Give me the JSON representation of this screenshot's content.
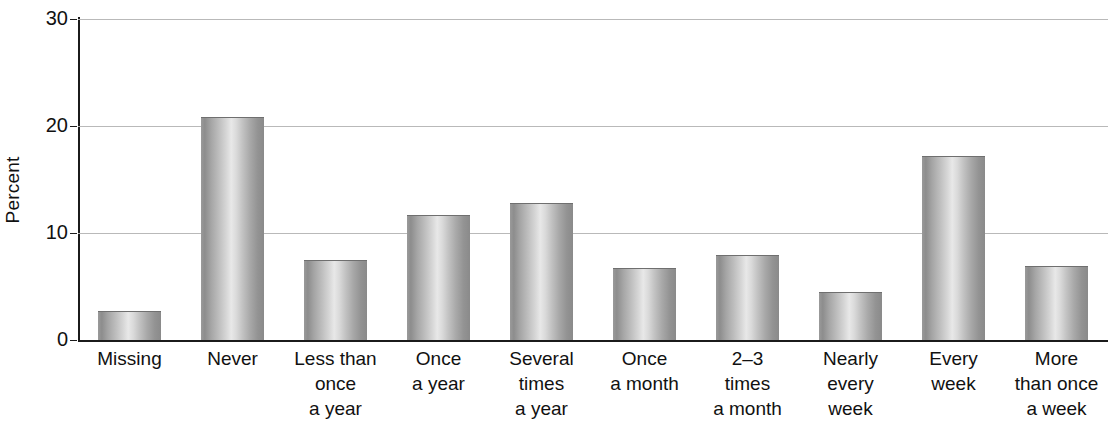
{
  "chart_data": {
    "type": "bar",
    "title": "",
    "xlabel": "",
    "ylabel": "Percent",
    "ylim": [
      0,
      30
    ],
    "yticks": [
      0,
      10,
      20,
      30
    ],
    "ytick_labels": [
      "0",
      "10",
      "20",
      "30"
    ],
    "grid": true,
    "legend": "none",
    "categories": [
      "Missing",
      "Never",
      "Less than once a year",
      "Once a year",
      "Several times a year",
      "Once a month",
      "2–3 times a month",
      "Nearly every week",
      "Every week",
      "More than once a week"
    ],
    "category_label_lines": [
      [
        "Missing"
      ],
      [
        "Never"
      ],
      [
        "Less than",
        "once",
        "a year"
      ],
      [
        "Once",
        "a year"
      ],
      [
        "Several",
        "times",
        "a year"
      ],
      [
        "Once",
        "a month"
      ],
      [
        "2–3",
        "times",
        "a month"
      ],
      [
        "Nearly",
        "every",
        "week"
      ],
      [
        "Every",
        "week"
      ],
      [
        "More",
        "than once",
        "a week"
      ]
    ],
    "values": [
      2.7,
      20.8,
      7.5,
      11.7,
      12.8,
      6.7,
      7.9,
      4.5,
      17.2,
      6.9
    ],
    "bar_color": "#b0b0b0"
  },
  "footer": {
    "partial_caption": ""
  }
}
